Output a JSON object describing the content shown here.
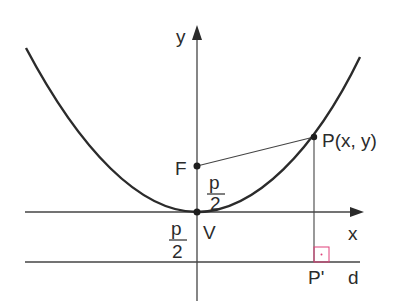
{
  "diagram": {
    "colors": {
      "stroke": "#2b2b2b",
      "axis": "#3a3a3a",
      "right_angle_marker": "#e0407a"
    },
    "labels": {
      "y_axis": "y",
      "x_axis": "x",
      "focus": "F",
      "vertex": "V",
      "point": "P(x, y)",
      "projection": "P'",
      "directrix": "d",
      "focus_dist_num": "p",
      "focus_dist_den": "2",
      "directrix_dist_num": "p",
      "directrix_dist_den": "2"
    },
    "points": {
      "F": [
        197,
        166
      ],
      "V": [
        197,
        212
      ],
      "P": [
        314,
        137
      ],
      "P_prime": [
        314,
        262
      ]
    }
  }
}
